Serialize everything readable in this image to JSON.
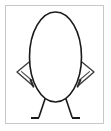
{
  "document": {
    "title": "Egg Character Line Drawing",
    "type": "line-art-illustration",
    "canvas": {
      "width": 111,
      "height": 131,
      "background_color": "#ffffff"
    }
  },
  "frame": {
    "name": "picture-frame",
    "x": 5,
    "y": 5,
    "width": 99,
    "height": 119,
    "stroke_color": "#c8c8c8",
    "stroke_width": 1,
    "fill_color": "#ffffff"
  },
  "figure": {
    "name": "egg-character",
    "stroke_color": "#1a1a1a",
    "arm_stroke_color": "#3c3c3c",
    "fill_color": "#ffffff",
    "body": {
      "name": "egg-body",
      "shape": "ellipse",
      "center_x": 55.5,
      "center_y": 57,
      "radius_x": 26,
      "radius_y": 45,
      "stroke_width": 1.6
    },
    "arms": [
      {
        "name": "left-arm",
        "side": "left",
        "shape": "bent-elbow-triangle",
        "shoulder_x": 34,
        "shoulder_y": 58,
        "elbow_x": 17,
        "elbow_y": 72,
        "hand_x": 32,
        "hand_y": 85,
        "stroke_width": 1.4
      },
      {
        "name": "right-arm",
        "side": "right",
        "shape": "bent-elbow-triangle",
        "shoulder_x": 77,
        "shoulder_y": 58,
        "elbow_x": 94,
        "elbow_y": 72,
        "hand_x": 79,
        "hand_y": 85,
        "stroke_width": 1.4
      }
    ],
    "legs": [
      {
        "name": "left-leg",
        "side": "left",
        "hip_x": 45,
        "hip_y": 99,
        "ankle_x": 39,
        "ankle_y": 117,
        "foot_toe_x": 31,
        "foot_toe_y": 118,
        "stroke_width": 1.6
      },
      {
        "name": "right-leg",
        "side": "right",
        "hip_x": 66,
        "hip_y": 99,
        "ankle_x": 72,
        "ankle_y": 117,
        "foot_toe_x": 80,
        "foot_toe_y": 118,
        "stroke_width": 1.6
      }
    ]
  },
  "labels": {
    "figure_alt": "Egg-shaped cartoon character standing with hands on hips"
  }
}
